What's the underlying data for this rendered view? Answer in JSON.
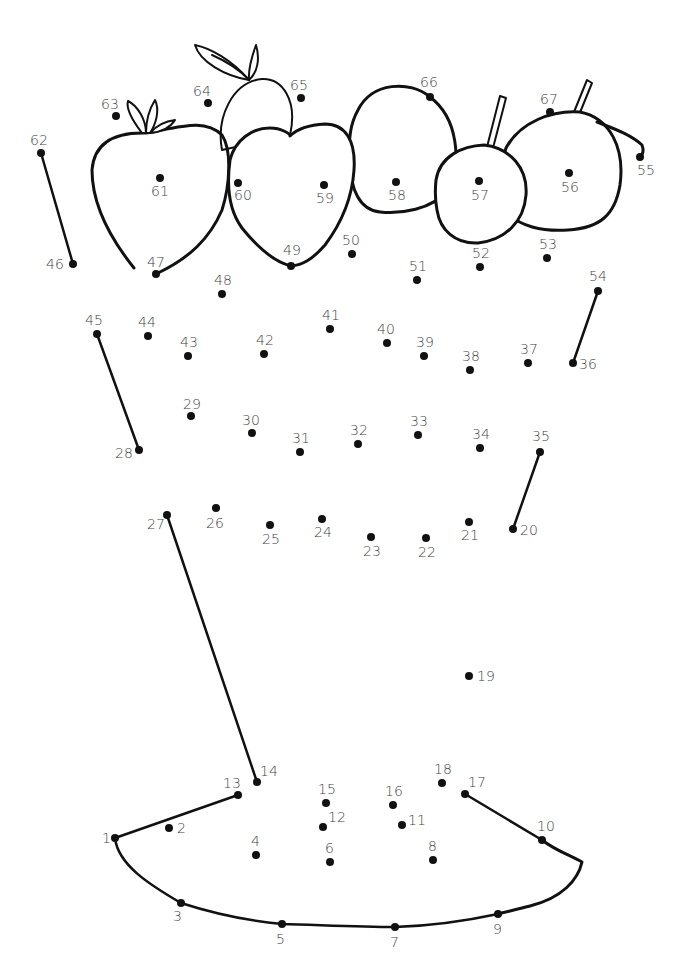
{
  "worksheet": {
    "type": "connect-the-dots",
    "ink_color": "#111111",
    "label_color": "#444444",
    "background": "#ffffff"
  },
  "dots": [
    {
      "n": 1,
      "x": 115,
      "y": 838,
      "lx": -13,
      "ly": 5
    },
    {
      "n": 2,
      "x": 169,
      "y": 828,
      "lx": 8,
      "ly": 5
    },
    {
      "n": 3,
      "x": 181,
      "y": 903,
      "lx": -8,
      "ly": 18
    },
    {
      "n": 4,
      "x": 256,
      "y": 855,
      "lx": -5,
      "ly": -9
    },
    {
      "n": 5,
      "x": 282,
      "y": 924,
      "lx": -6,
      "ly": 20
    },
    {
      "n": 6,
      "x": 330,
      "y": 862,
      "lx": -5,
      "ly": -9
    },
    {
      "n": 7,
      "x": 395,
      "y": 927,
      "lx": -5,
      "ly": 20
    },
    {
      "n": 8,
      "x": 433,
      "y": 860,
      "lx": -5,
      "ly": -9
    },
    {
      "n": 9,
      "x": 498,
      "y": 914,
      "lx": -5,
      "ly": 20
    },
    {
      "n": 10,
      "x": 542,
      "y": 840,
      "lx": -5,
      "ly": -9
    },
    {
      "n": 11,
      "x": 402,
      "y": 825,
      "lx": 6,
      "ly": 0
    },
    {
      "n": 12,
      "x": 323,
      "y": 827,
      "lx": 5,
      "ly": -5
    },
    {
      "n": 13,
      "x": 238,
      "y": 795,
      "lx": -15,
      "ly": -7
    },
    {
      "n": 14,
      "x": 257,
      "y": 782,
      "lx": 3,
      "ly": -6
    },
    {
      "n": 15,
      "x": 326,
      "y": 803,
      "lx": -8,
      "ly": -9
    },
    {
      "n": 16,
      "x": 393,
      "y": 805,
      "lx": -8,
      "ly": -9
    },
    {
      "n": 17,
      "x": 465,
      "y": 794,
      "lx": 3,
      "ly": -7
    },
    {
      "n": 18,
      "x": 442,
      "y": 783,
      "lx": -8,
      "ly": -9
    },
    {
      "n": 19,
      "x": 469,
      "y": 676,
      "lx": 8,
      "ly": 5
    },
    {
      "n": 20,
      "x": 513,
      "y": 529,
      "lx": 7,
      "ly": 6
    },
    {
      "n": 21,
      "x": 469,
      "y": 522,
      "lx": -8,
      "ly": 18
    },
    {
      "n": 22,
      "x": 426,
      "y": 538,
      "lx": -8,
      "ly": 19
    },
    {
      "n": 23,
      "x": 371,
      "y": 537,
      "lx": -8,
      "ly": 19
    },
    {
      "n": 24,
      "x": 322,
      "y": 519,
      "lx": -8,
      "ly": 18
    },
    {
      "n": 25,
      "x": 270,
      "y": 525,
      "lx": -8,
      "ly": 19
    },
    {
      "n": 26,
      "x": 216,
      "y": 508,
      "lx": -10,
      "ly": 20
    },
    {
      "n": 27,
      "x": 167,
      "y": 515,
      "lx": -20,
      "ly": 14
    },
    {
      "n": 28,
      "x": 139,
      "y": 450,
      "lx": -24,
      "ly": 8
    },
    {
      "n": 29,
      "x": 191,
      "y": 416,
      "lx": -8,
      "ly": -7
    },
    {
      "n": 30,
      "x": 252,
      "y": 433,
      "lx": -10,
      "ly": -8
    },
    {
      "n": 31,
      "x": 300,
      "y": 452,
      "lx": -8,
      "ly": -9
    },
    {
      "n": 32,
      "x": 358,
      "y": 444,
      "lx": -8,
      "ly": -9
    },
    {
      "n": 33,
      "x": 418,
      "y": 435,
      "lx": -8,
      "ly": -9
    },
    {
      "n": 34,
      "x": 480,
      "y": 448,
      "lx": -8,
      "ly": -9
    },
    {
      "n": 35,
      "x": 540,
      "y": 452,
      "lx": -8,
      "ly": -11
    },
    {
      "n": 36,
      "x": 573,
      "y": 363,
      "lx": 6,
      "ly": 6
    },
    {
      "n": 37,
      "x": 528,
      "y": 363,
      "lx": -8,
      "ly": -9
    },
    {
      "n": 38,
      "x": 470,
      "y": 370,
      "lx": -8,
      "ly": -9
    },
    {
      "n": 39,
      "x": 424,
      "y": 356,
      "lx": -8,
      "ly": -9
    },
    {
      "n": 40,
      "x": 387,
      "y": 343,
      "lx": -10,
      "ly": -9
    },
    {
      "n": 41,
      "x": 330,
      "y": 329,
      "lx": -8,
      "ly": -9
    },
    {
      "n": 42,
      "x": 264,
      "y": 354,
      "lx": -8,
      "ly": -9
    },
    {
      "n": 43,
      "x": 188,
      "y": 356,
      "lx": -8,
      "ly": -9
    },
    {
      "n": 44,
      "x": 148,
      "y": 336,
      "lx": -10,
      "ly": -9
    },
    {
      "n": 45,
      "x": 97,
      "y": 334,
      "lx": -12,
      "ly": -9
    },
    {
      "n": 46,
      "x": 73,
      "y": 264,
      "lx": -27,
      "ly": 5
    },
    {
      "n": 47,
      "x": 156,
      "y": 274,
      "lx": -9,
      "ly": -7
    },
    {
      "n": 48,
      "x": 222,
      "y": 294,
      "lx": -8,
      "ly": -9
    },
    {
      "n": 49,
      "x": 291,
      "y": 266,
      "lx": -8,
      "ly": -11
    },
    {
      "n": 50,
      "x": 352,
      "y": 254,
      "lx": -10,
      "ly": -9
    },
    {
      "n": 51,
      "x": 417,
      "y": 280,
      "lx": -8,
      "ly": -9
    },
    {
      "n": 52,
      "x": 480,
      "y": 267,
      "lx": -8,
      "ly": -9
    },
    {
      "n": 53,
      "x": 547,
      "y": 258,
      "lx": -8,
      "ly": -9
    },
    {
      "n": 54,
      "x": 598,
      "y": 291,
      "lx": -9,
      "ly": -10
    },
    {
      "n": 55,
      "x": 640,
      "y": 157,
      "lx": -3,
      "ly": 18
    },
    {
      "n": 56,
      "x": 569,
      "y": 173,
      "lx": -8,
      "ly": 19
    },
    {
      "n": 57,
      "x": 479,
      "y": 181,
      "lx": -8,
      "ly": 19
    },
    {
      "n": 58,
      "x": 396,
      "y": 182,
      "lx": -8,
      "ly": 18
    },
    {
      "n": 59,
      "x": 324,
      "y": 185,
      "lx": -8,
      "ly": 18
    },
    {
      "n": 60,
      "x": 238,
      "y": 183,
      "lx": -4,
      "ly": 17
    },
    {
      "n": 61,
      "x": 160,
      "y": 178,
      "lx": -9,
      "ly": 18
    },
    {
      "n": 62,
      "x": 41,
      "y": 153,
      "lx": -11,
      "ly": -8
    },
    {
      "n": 63,
      "x": 116,
      "y": 116,
      "lx": -15,
      "ly": -7
    },
    {
      "n": 64,
      "x": 208,
      "y": 103,
      "lx": -15,
      "ly": -7
    },
    {
      "n": 65,
      "x": 301,
      "y": 98,
      "lx": -11,
      "ly": -8
    },
    {
      "n": 66,
      "x": 430,
      "y": 97,
      "lx": -10,
      "ly": -10
    },
    {
      "n": 67,
      "x": 550,
      "y": 112,
      "lx": -10,
      "ly": -8
    }
  ],
  "drawn_segments": [
    [
      62,
      46
    ],
    [
      45,
      28
    ],
    [
      54,
      36
    ],
    [
      35,
      20
    ],
    [
      27,
      14
    ],
    [
      13,
      1
    ],
    [
      17,
      10
    ]
  ]
}
